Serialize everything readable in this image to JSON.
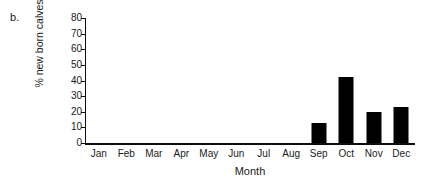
{
  "figure": {
    "panel_label": "b.",
    "background_color": "#ffffff",
    "bar_color": "#000000",
    "axis_color": "#0d0d0d"
  },
  "chart_data": {
    "type": "bar",
    "title": "",
    "xlabel": "Month",
    "ylabel": "% new born calves",
    "categories": [
      "Jan",
      "Feb",
      "Mar",
      "Apr",
      "May",
      "Jun",
      "Jul",
      "Aug",
      "Sep",
      "Oct",
      "Nov",
      "Dec"
    ],
    "values": [
      0,
      0,
      0,
      0,
      0,
      0,
      0,
      0,
      13,
      42,
      20,
      23
    ],
    "ylim": [
      0,
      80
    ],
    "yticks": [
      0,
      10,
      20,
      30,
      40,
      50,
      60,
      70,
      80
    ],
    "ytick_labels": [
      "0",
      "10",
      "20",
      "30",
      "40",
      "50",
      "60",
      "70",
      "80"
    ],
    "grid": false,
    "legend": false,
    "legend_position": "none"
  }
}
